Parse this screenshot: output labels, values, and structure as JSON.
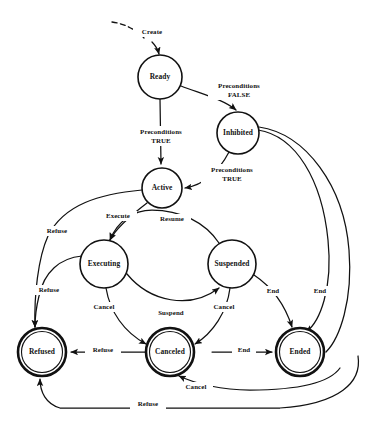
{
  "diagram": {
    "type": "state-machine",
    "stroke_color": "#111111",
    "background_color": "#ffffff",
    "states": [
      {
        "id": "ready",
        "label": "Ready",
        "kind": "normal",
        "cx": 160,
        "cy": 77,
        "r": 22
      },
      {
        "id": "inhibited",
        "label": "Inhibited",
        "kind": "normal",
        "cx": 238,
        "cy": 133,
        "r": 21
      },
      {
        "id": "active",
        "label": "Active",
        "kind": "normal",
        "cx": 162,
        "cy": 188,
        "r": 20
      },
      {
        "id": "executing",
        "label": "Executing",
        "kind": "normal",
        "cx": 104,
        "cy": 264,
        "r": 24
      },
      {
        "id": "suspended",
        "label": "Suspended",
        "kind": "normal",
        "cx": 232,
        "cy": 264,
        "r": 24
      },
      {
        "id": "refused",
        "label": "Refused",
        "kind": "final",
        "cx": 42,
        "cy": 352,
        "r": 24
      },
      {
        "id": "canceled",
        "label": "Canceled",
        "kind": "final",
        "cx": 170,
        "cy": 352,
        "r": 24
      },
      {
        "id": "ended",
        "label": "Ended",
        "kind": "final",
        "cx": 300,
        "cy": 352,
        "r": 24
      }
    ],
    "transitions": [
      {
        "id": "t-create",
        "from": "start",
        "to": "ready",
        "label": "Create",
        "label_x": 152,
        "label_y": 32,
        "style": "dashed"
      },
      {
        "id": "t-ready-inhibited",
        "from": "ready",
        "to": "inhibited",
        "label": "Preconditions\nFALSE",
        "label_x": 239,
        "label_y": 86,
        "style": "solid"
      },
      {
        "id": "t-ready-active",
        "from": "ready",
        "to": "active",
        "label": "Preconditions\nTRUE",
        "label_x": 161,
        "label_y": 132,
        "style": "solid"
      },
      {
        "id": "t-inhibited-active",
        "from": "inhibited",
        "to": "active",
        "label": "Preconditions\nTRUE",
        "label_x": 232,
        "label_y": 170,
        "style": "solid"
      },
      {
        "id": "t-active-executing",
        "from": "active",
        "to": "executing",
        "label": "Execute",
        "label_x": 118,
        "label_y": 216,
        "style": "solid"
      },
      {
        "id": "t-suspended-executing",
        "from": "suspended",
        "to": "executing",
        "label": "Resume",
        "label_x": 172,
        "label_y": 219,
        "style": "solid"
      },
      {
        "id": "t-executing-suspended",
        "from": "executing",
        "to": "suspended",
        "label": "Suspend",
        "label_x": 171,
        "label_y": 313,
        "style": "solid"
      },
      {
        "id": "t-active-refused",
        "from": "active",
        "to": "refused",
        "label": "Refuse",
        "label_x": 57,
        "label_y": 231,
        "style": "solid"
      },
      {
        "id": "t-executing-refused",
        "from": "executing",
        "to": "refused",
        "label": "Refuse",
        "label_x": 49,
        "label_y": 290,
        "style": "solid"
      },
      {
        "id": "t-canceled-refused",
        "from": "canceled",
        "to": "refused",
        "label": "Refuse",
        "label_x": 103,
        "label_y": 350,
        "style": "solid"
      },
      {
        "id": "t-executing-canceled",
        "from": "executing",
        "to": "canceled",
        "label": "Cancel",
        "label_x": 104,
        "label_y": 307,
        "style": "solid"
      },
      {
        "id": "t-suspended-canceled",
        "from": "suspended",
        "to": "canceled",
        "label": "Cancel",
        "label_x": 224,
        "label_y": 307,
        "style": "solid"
      },
      {
        "id": "t-suspended-ended",
        "from": "suspended",
        "to": "ended",
        "label": "End",
        "label_x": 273,
        "label_y": 291,
        "style": "solid"
      },
      {
        "id": "t-canceled-ended",
        "from": "canceled",
        "to": "ended",
        "label": "End",
        "label_x": 244,
        "label_y": 350,
        "style": "solid"
      },
      {
        "id": "t-inhibited-ended",
        "from": "inhibited",
        "to": "ended",
        "label": "End",
        "label_x": 320,
        "label_y": 291,
        "style": "solid"
      },
      {
        "id": "t-bottom-cancel",
        "from": "ended",
        "to": "canceled",
        "label": "Cancel",
        "label_x": 196,
        "label_y": 387,
        "style": "solid"
      },
      {
        "id": "t-bottom-refuse",
        "from": "ended",
        "to": "refused",
        "label": "Refuse",
        "label_x": 148,
        "label_y": 404,
        "style": "solid"
      }
    ],
    "label_lines": {
      "preconditions_false_1": "Preconditions",
      "preconditions_false_2": "FALSE",
      "preconditions_true_1": "Preconditions",
      "preconditions_true_2": "TRUE",
      "preconditions_true_b1": "Preconditions",
      "preconditions_true_b2": "TRUE"
    }
  }
}
